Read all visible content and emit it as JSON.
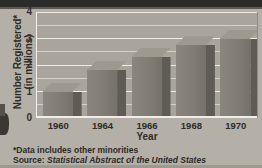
{
  "chart_data": {
    "type": "bar",
    "title": "",
    "xlabel": "Year",
    "ylabel": "Number Registered* (in millions)",
    "ylabel_line1": "Number Registered*",
    "ylabel_line2": "(in millions)",
    "categories": [
      "1960",
      "1964",
      "1966",
      "1968",
      "1970"
    ],
    "values": [
      1.0,
      1.8,
      2.3,
      2.75,
      3.0
    ],
    "ylim": [
      0,
      4
    ],
    "yticks": [
      0,
      1,
      2,
      3,
      4
    ],
    "ytick_labels": [
      "0",
      "1",
      "2",
      "3",
      "4"
    ],
    "minor_gridline_step": 0.5,
    "grid": true,
    "legend": "none",
    "style": "3d-bars-grayscale",
    "colors": {
      "bar_face": "#817d75",
      "bar_side": "#5f5c55",
      "bar_top": "#9d998f",
      "plot_background": "#a9a59c",
      "page_background": "#b4b0a7",
      "gridline": "#ecebe4",
      "text": "#2e2c28"
    }
  },
  "notes": {
    "footnote": "*Data includes other minorities",
    "source_prefix": "Source: ",
    "source_title": "Statistical Abstract of the United States"
  }
}
